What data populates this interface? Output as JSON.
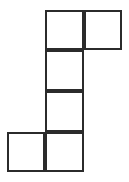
{
  "figure": {
    "kind": "polyomino-grid-figure",
    "background_color": "#ffffff",
    "stroke_color": "#2b2b2b",
    "fill_color": "#ffffff",
    "stroke_width": 2,
    "canvas": {
      "width": 129,
      "height": 182
    },
    "grid": {
      "columns": 3,
      "rows": 4,
      "cell_width": 39,
      "cell_height": 40.5,
      "origin_x": 7,
      "origin_y": 10,
      "column_edges_x": [
        7,
        45,
        84,
        122
      ],
      "row_edges_y": [
        10,
        50,
        91,
        132,
        172
      ]
    },
    "square_count": 6,
    "squares": [
      {
        "id": "cell-c1-r0",
        "col": 1,
        "row": 0,
        "x": 45,
        "y": 10,
        "width": 39,
        "height": 40
      },
      {
        "id": "cell-c2-r0",
        "col": 2,
        "row": 0,
        "x": 84,
        "y": 10,
        "width": 38,
        "height": 40
      },
      {
        "id": "cell-c1-r1",
        "col": 1,
        "row": 1,
        "x": 45,
        "y": 50,
        "width": 39,
        "height": 41
      },
      {
        "id": "cell-c1-r2",
        "col": 1,
        "row": 2,
        "x": 45,
        "y": 91,
        "width": 39,
        "height": 41
      },
      {
        "id": "cell-c0-r3",
        "col": 0,
        "row": 3,
        "x": 7,
        "y": 132,
        "width": 38,
        "height": 40
      },
      {
        "id": "cell-c1-r3",
        "col": 1,
        "row": 3,
        "x": 45,
        "y": 132,
        "width": 39,
        "height": 40
      }
    ]
  }
}
